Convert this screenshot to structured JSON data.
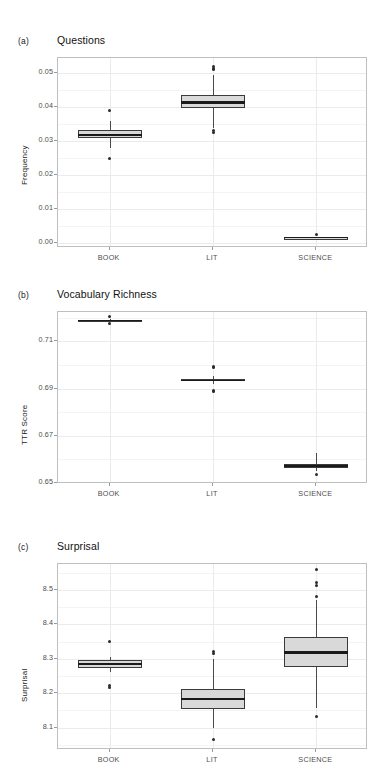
{
  "figure": {
    "width": 388,
    "height": 783,
    "background": "#ffffff",
    "box_fill": "#d9d9d9",
    "box_stroke": "#3a3a3a",
    "grid_major_color": "#ebebeb",
    "grid_minor_color": "#f4f4f4",
    "panel_border_color": "#bfbfbf"
  },
  "panels": [
    {
      "label": "(a)",
      "title": "Questions",
      "ylabel": "Frequency",
      "categories": [
        "BOOK",
        "LIT",
        "SCIENCE"
      ],
      "yticks": [
        "0.00",
        "0.01",
        "0.02",
        "0.03",
        "0.04",
        "0.05"
      ]
    },
    {
      "label": "(b)",
      "title": "Vocabulary Richness",
      "ylabel": "TTR Score",
      "categories": [
        "BOOK",
        "LIT",
        "SCIENCE"
      ],
      "yticks": [
        "0.65",
        "0.67",
        "0.69",
        "0.71"
      ]
    },
    {
      "label": "(c)",
      "title": "Surprisal",
      "ylabel": "Surprisal",
      "categories": [
        "BOOK",
        "LIT",
        "SCIENCE"
      ],
      "yticks": [
        "8.1",
        "8.2",
        "8.3",
        "8.4",
        "8.5"
      ]
    }
  ],
  "chart_data": [
    {
      "type": "box",
      "panel": "a",
      "title": "Questions",
      "xlabel": "",
      "ylabel": "Frequency",
      "categories": [
        "BOOK",
        "LIT",
        "SCIENCE"
      ],
      "ylim": [
        -0.0015,
        0.0545
      ],
      "yticks": [
        0.0,
        0.01,
        0.02,
        0.03,
        0.04,
        0.05
      ],
      "ytick_labels": [
        "0.00",
        "0.01",
        "0.02",
        "0.03",
        "0.04",
        "0.05"
      ],
      "grid": true,
      "legend": "none",
      "boxes": [
        {
          "category": "BOOK",
          "lower_whisker": 0.028,
          "q1": 0.0309,
          "median": 0.0319,
          "q3": 0.0334,
          "upper_whisker": 0.036,
          "outliers": [
            0.039,
            0.0248
          ]
        },
        {
          "category": "LIT",
          "lower_whisker": 0.0338,
          "q1": 0.0398,
          "median": 0.0414,
          "q3": 0.0436,
          "upper_whisker": 0.0496,
          "outliers": [
            0.051,
            0.0515,
            0.0521,
            0.0325,
            0.033
          ]
        },
        {
          "category": "SCIENCE",
          "lower_whisker": 0.0014,
          "q1": 0.0015,
          "median": 0.0016,
          "q3": 0.0017,
          "upper_whisker": 0.0018,
          "outliers": [
            0.0024
          ]
        }
      ]
    },
    {
      "type": "box",
      "panel": "b",
      "title": "Vocabulary Richness",
      "xlabel": "",
      "ylabel": "TTR Score",
      "categories": [
        "BOOK",
        "LIT",
        "SCIENCE"
      ],
      "ylim": [
        0.6495,
        0.7225
      ],
      "yticks": [
        0.65,
        0.67,
        0.69,
        0.71
      ],
      "ytick_labels": [
        "0.65",
        "0.67",
        "0.69",
        "0.71"
      ],
      "grid": true,
      "legend": "none",
      "boxes": [
        {
          "category": "BOOK",
          "lower_whisker": 0.7185,
          "q1": 0.7188,
          "median": 0.719,
          "q3": 0.7193,
          "upper_whisker": 0.7196,
          "outliers": [
            0.7205,
            0.7178
          ]
        },
        {
          "category": "LIT",
          "lower_whisker": 0.692,
          "q1": 0.693,
          "median": 0.6935,
          "q3": 0.6942,
          "upper_whisker": 0.6955,
          "outliers": [
            0.699,
            0.6995,
            0.6888,
            0.6893
          ]
        },
        {
          "category": "SCIENCE",
          "lower_whisker": 0.655,
          "q1": 0.6565,
          "median": 0.6572,
          "q3": 0.658,
          "upper_whisker": 0.6625,
          "outliers": [
            0.6535
          ]
        }
      ]
    },
    {
      "type": "box",
      "panel": "c",
      "title": "Surprisal",
      "xlabel": "",
      "ylabel": "Surprisal",
      "categories": [
        "BOOK",
        "LIT",
        "SCIENCE"
      ],
      "ylim": [
        8.035,
        8.575
      ],
      "yticks": [
        8.1,
        8.2,
        8.3,
        8.4,
        8.5
      ],
      "ytick_labels": [
        "8.1",
        "8.2",
        "8.3",
        "8.4",
        "8.5"
      ],
      "grid": true,
      "legend": "none",
      "boxes": [
        {
          "category": "BOOK",
          "lower_whisker": 8.262,
          "q1": 8.272,
          "median": 8.285,
          "q3": 8.295,
          "upper_whisker": 8.305,
          "outliers": [
            8.35,
            8.222,
            8.216
          ]
        },
        {
          "category": "LIT",
          "lower_whisker": 8.1,
          "q1": 8.155,
          "median": 8.182,
          "q3": 8.213,
          "upper_whisker": 8.3,
          "outliers": [
            8.322,
            8.316,
            8.065,
            8.035
          ]
        },
        {
          "category": "SCIENCE",
          "lower_whisker": 8.158,
          "q1": 8.277,
          "median": 8.318,
          "q3": 8.362,
          "upper_whisker": 8.47,
          "outliers": [
            8.558,
            8.522,
            8.512,
            8.482,
            8.132
          ]
        }
      ]
    }
  ]
}
